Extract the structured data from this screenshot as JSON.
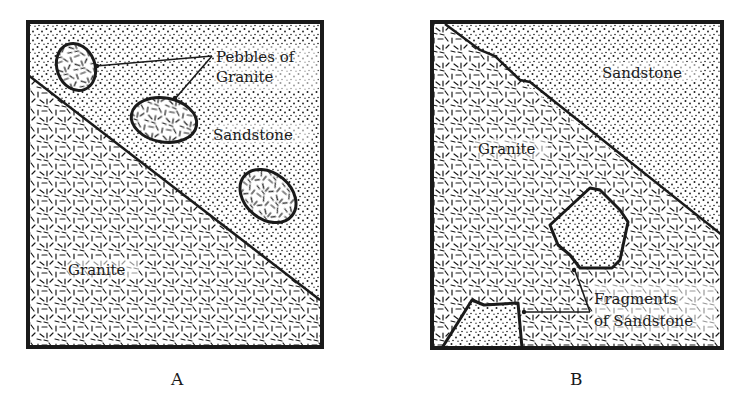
{
  "figure": {
    "panels": [
      {
        "id": "A",
        "caption": "A",
        "labels": {
          "pebbles": [
            "Pebbles of",
            "Granite"
          ],
          "upper_region": "Sandstone",
          "lower_region": "Granite"
        },
        "description": "Sandstone overlying granite, containing pebbles of granite"
      },
      {
        "id": "B",
        "caption": "B",
        "labels": {
          "upper_region": "Sandstone",
          "lower_region": "Granite",
          "fragments": [
            "Fragments",
            "of Sandstone"
          ]
        },
        "description": "Granite intruding sandstone, containing fragments of sandstone"
      }
    ],
    "legend": {
      "sandstone_pattern": "dots",
      "granite_pattern": "short-dashes"
    },
    "colors": {
      "ink": "#1a1a1a",
      "paper": "#ffffff"
    }
  }
}
